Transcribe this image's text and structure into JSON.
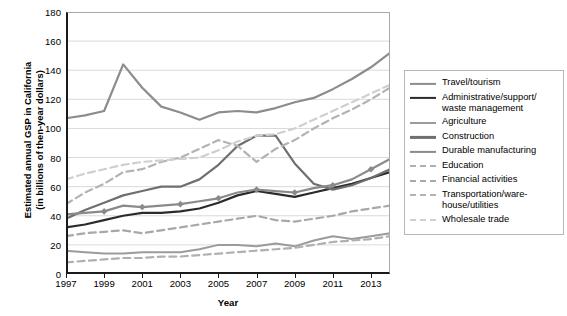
{
  "chart_data": {
    "type": "line",
    "title": "",
    "xlabel": "Year",
    "ylabel": "Estimated annual GSP in California (in billions of then-year dollars)",
    "ylabel_line1": "Estimated annual GSP in California",
    "ylabel_line2": "(in billions of then-year dollars)",
    "x": [
      1997,
      1998,
      1999,
      2000,
      2001,
      2002,
      2003,
      2004,
      2005,
      2006,
      2007,
      2008,
      2009,
      2010,
      2011,
      2012,
      2013,
      2014
    ],
    "xticks": [
      "1997",
      "1999",
      "2001",
      "2003",
      "2005",
      "2007",
      "2009",
      "2011",
      "2013"
    ],
    "yticks": [
      "0",
      "20",
      "40",
      "60",
      "80",
      "100",
      "120",
      "140",
      "160",
      "180"
    ],
    "xlim": [
      1997,
      2014
    ],
    "ylim": [
      0,
      180
    ],
    "grid": "horizontal",
    "legend_position": "right",
    "series": [
      {
        "name": "Travel/tourism",
        "color": "#8c8c8c",
        "width": 2.2,
        "dash": "solid",
        "marker": "none",
        "values": [
          107,
          109,
          112,
          144,
          128,
          115,
          111,
          106,
          111,
          112,
          111,
          114,
          118,
          121,
          127,
          134,
          142,
          152
        ]
      },
      {
        "name": "Administrative/support/waste management",
        "name_line1": "Administrative/support/",
        "name_line2": "waste management",
        "color": "#2b2b2b",
        "width": 2.2,
        "dash": "solid",
        "marker": "none",
        "values": [
          32,
          34,
          37,
          40,
          42,
          42,
          43,
          45,
          49,
          54,
          57,
          55,
          53,
          56,
          59,
          62,
          66,
          70
        ]
      },
      {
        "name": "Agriculture",
        "color": "#9b9b9b",
        "width": 2.0,
        "dash": "solid",
        "marker": "none",
        "values": [
          16,
          15,
          14,
          14,
          15,
          15,
          15,
          17,
          20,
          20,
          19,
          21,
          19,
          23,
          26,
          24,
          26,
          28
        ]
      },
      {
        "name": "Construction",
        "color": "#6f6f6f",
        "width": 2.2,
        "dash": "solid",
        "marker": "none",
        "values": [
          38,
          44,
          49,
          54,
          57,
          60,
          60,
          65,
          75,
          88,
          95,
          95,
          76,
          62,
          58,
          61,
          66,
          72
        ]
      },
      {
        "name": "Durable manufacturing",
        "color": "#8a8a8a",
        "width": 2.2,
        "dash": "solid",
        "marker": "diamond",
        "values": [
          41,
          42,
          43,
          47,
          46,
          47,
          48,
          50,
          52,
          56,
          58,
          57,
          56,
          59,
          61,
          65,
          72,
          79
        ]
      },
      {
        "name": "Education",
        "color": "#b0b0b0",
        "width": 2.2,
        "dash": "dash",
        "marker": "none",
        "values": [
          8,
          9,
          10,
          11,
          11,
          12,
          12,
          13,
          14,
          15,
          16,
          17,
          18,
          20,
          22,
          23,
          24,
          26
        ]
      },
      {
        "name": "Financial activities",
        "color": "#a8a8a8",
        "width": 2.2,
        "dash": "dash",
        "marker": "none",
        "values": [
          26,
          28,
          29,
          30,
          28,
          30,
          32,
          34,
          36,
          38,
          40,
          37,
          36,
          38,
          40,
          43,
          45,
          47
        ]
      },
      {
        "name": "Transportation/warehouse/utilities",
        "name_line1": "Transportation/ware-",
        "name_line2": "house/utilities",
        "color": "#b3b3b3",
        "width": 2.2,
        "dash": "dash",
        "marker": "none",
        "values": [
          48,
          56,
          62,
          70,
          72,
          77,
          80,
          86,
          92,
          88,
          77,
          86,
          92,
          100,
          107,
          113,
          120,
          128
        ]
      },
      {
        "name": "Wholesale trade",
        "color": "#cfcfcf",
        "width": 2.2,
        "dash": "dash",
        "marker": "none",
        "values": [
          65,
          69,
          72,
          75,
          77,
          78,
          79,
          80,
          85,
          91,
          95,
          96,
          100,
          106,
          112,
          118,
          124,
          130
        ]
      }
    ]
  }
}
